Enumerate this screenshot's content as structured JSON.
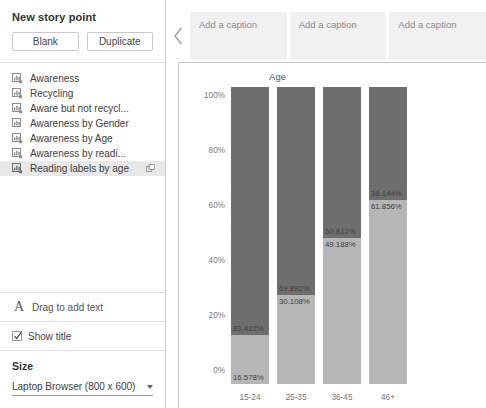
{
  "sidebar": {
    "title": "New story point",
    "buttons": [
      {
        "label": "Blank",
        "name": "blank-button"
      },
      {
        "label": "Duplicate",
        "name": "duplicate-button"
      }
    ],
    "sheets": [
      {
        "label": "Awareness",
        "selected": false,
        "external": false
      },
      {
        "label": "Recycling",
        "selected": false,
        "external": false
      },
      {
        "label": "Aware but not recycl...",
        "selected": false,
        "external": false
      },
      {
        "label": "Awareness by Gender",
        "selected": false,
        "external": false
      },
      {
        "label": "Awareness by Age",
        "selected": false,
        "external": false
      },
      {
        "label": "Awareness by readi...",
        "selected": false,
        "external": false
      },
      {
        "label": "Reading labels by age",
        "selected": true,
        "external": true
      }
    ],
    "drag_text": "Drag to add text",
    "show_title": {
      "label": "Show title",
      "checked": true
    },
    "size": {
      "heading": "Size",
      "value": "Laptop Browser (800 x 600)"
    }
  },
  "canvas": {
    "nav_prev_icon": "chevron-left-icon",
    "captions": [
      "Add a caption",
      "Add a caption",
      "Add a caption"
    ]
  },
  "colors": {
    "segment_top": "#6e6e6e",
    "segment_bottom": "#b6b6b6",
    "caption_bg": "#f1f1f1",
    "border": "#c9c9c9"
  },
  "chart_data": {
    "type": "bar",
    "stacked": true,
    "percent": true,
    "title": "Age",
    "xlabel": "",
    "ylabel": "% of Total Number of Records",
    "categories": [
      "15-24",
      "25-35",
      "36-45",
      "46+"
    ],
    "ytick_labels": [
      "100%",
      "80%",
      "60%",
      "40%",
      "20%",
      "0%"
    ],
    "ytick_values": [
      100,
      80,
      60,
      40,
      20,
      0
    ],
    "ylim": [
      0,
      100
    ],
    "grid": false,
    "legend": "none",
    "series": [
      {
        "name": "top",
        "color": "#6e6e6e",
        "values": [
          83.422,
          69.892,
          50.812,
          38.144
        ],
        "labels": [
          "83.422%",
          "69.892%",
          "50.812%",
          "38.144%"
        ]
      },
      {
        "name": "bottom",
        "color": "#b6b6b6",
        "values": [
          16.578,
          30.108,
          49.188,
          61.856
        ],
        "labels": [
          "16.578%",
          "30.108%",
          "49.188%",
          "61.856%"
        ]
      }
    ]
  }
}
